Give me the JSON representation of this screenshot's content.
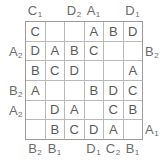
{
  "puzzle": {
    "title": "Easy as ABC letter grid",
    "size": {
      "rows": 6,
      "cols": 6
    },
    "colors": {
      "grid_line": "#b9b9b9",
      "grid_frame": "#9a9a9a",
      "text": "#5a5a5a",
      "clue_text": "#6b6b6b",
      "background": "#ffffff"
    },
    "grid": [
      [
        "C",
        "",
        "",
        "A",
        "B",
        "D"
      ],
      [
        "D",
        "A",
        "B",
        "C",
        "",
        ""
      ],
      [
        "B",
        "C",
        "D",
        "",
        "",
        "A"
      ],
      [
        "A",
        "",
        "",
        "B",
        "D",
        "C"
      ],
      [
        "",
        "D",
        "A",
        "",
        "C",
        "B"
      ],
      [
        "",
        "B",
        "C",
        "D",
        "A",
        ""
      ]
    ],
    "clues": {
      "top": [
        {
          "col": 1,
          "letter": "C",
          "count": "1"
        },
        {
          "col": 2,
          "letter": "",
          "count": ""
        },
        {
          "col": 3,
          "letter": "D",
          "count": "2"
        },
        {
          "col": 4,
          "letter": "A",
          "count": "1"
        },
        {
          "col": 5,
          "letter": "",
          "count": ""
        },
        {
          "col": 6,
          "letter": "D",
          "count": "1"
        }
      ],
      "bottom": [
        {
          "col": 1,
          "letter": "B",
          "count": "2"
        },
        {
          "col": 2,
          "letter": "B",
          "count": "1"
        },
        {
          "col": 3,
          "letter": "",
          "count": ""
        },
        {
          "col": 4,
          "letter": "D",
          "count": "1"
        },
        {
          "col": 5,
          "letter": "C",
          "count": "2"
        },
        {
          "col": 6,
          "letter": "B",
          "count": "1"
        }
      ],
      "left": [
        {
          "row": 1,
          "letter": "",
          "count": ""
        },
        {
          "row": 2,
          "letter": "A",
          "count": "2"
        },
        {
          "row": 3,
          "letter": "",
          "count": ""
        },
        {
          "row": 4,
          "letter": "B",
          "count": "2"
        },
        {
          "row": 5,
          "letter": "A",
          "count": "2"
        },
        {
          "row": 6,
          "letter": "",
          "count": ""
        }
      ],
      "right": [
        {
          "row": 1,
          "letter": "",
          "count": ""
        },
        {
          "row": 2,
          "letter": "B",
          "count": "2"
        },
        {
          "row": 3,
          "letter": "",
          "count": ""
        },
        {
          "row": 4,
          "letter": "",
          "count": ""
        },
        {
          "row": 5,
          "letter": "",
          "count": ""
        },
        {
          "row": 6,
          "letter": "A",
          "count": "1"
        }
      ]
    }
  }
}
